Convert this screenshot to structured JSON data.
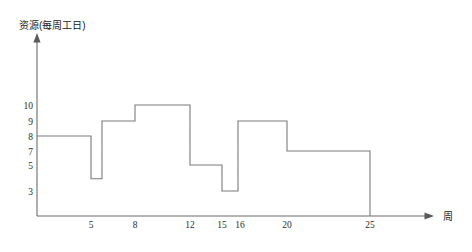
{
  "chart_data": {
    "type": "line",
    "subtype": "step",
    "title": "",
    "ylabel": "资源(每周工日)",
    "xlabel": "周",
    "grid": false,
    "legend": null,
    "xlim": [
      0,
      28
    ],
    "ylim": [
      0,
      11.5
    ],
    "x_ticks": [
      5,
      8,
      12,
      15,
      16,
      20,
      25
    ],
    "x_tick_labels": [
      "5",
      "8",
      "12",
      "15",
      "16",
      "20",
      "25"
    ],
    "y_ticks": [
      10,
      9,
      8,
      7,
      5,
      3
    ],
    "y_tick_labels": [
      "10",
      "9",
      "8",
      "7",
      "5",
      "3"
    ],
    "segments": [
      {
        "x_start": 0,
        "x_end": 5,
        "value": 8
      },
      {
        "x_start": 5,
        "x_end": 6,
        "value": 4
      },
      {
        "x_start": 6,
        "x_end": 8,
        "value": 9
      },
      {
        "x_start": 8,
        "x_end": 12,
        "value": 10
      },
      {
        "x_start": 12,
        "x_end": 15,
        "value": 5
      },
      {
        "x_start": 15,
        "x_end": 16,
        "value": 3
      },
      {
        "x_start": 16,
        "x_end": 20,
        "value": 9
      },
      {
        "x_start": 20,
        "x_end": 25,
        "value": 7
      }
    ],
    "x": [
      0,
      5,
      5,
      6,
      6,
      8,
      8,
      12,
      12,
      15,
      15,
      16,
      16,
      20,
      20,
      25,
      25
    ],
    "values": [
      8,
      8,
      4,
      4,
      9,
      9,
      10,
      10,
      5,
      5,
      3,
      3,
      9,
      9,
      7,
      7,
      0
    ],
    "line_color": "#7a7a7a",
    "axis_color": "#6b6b6b"
  },
  "axes": {
    "y_title": "资源(每周工日)",
    "x_title": "周"
  }
}
